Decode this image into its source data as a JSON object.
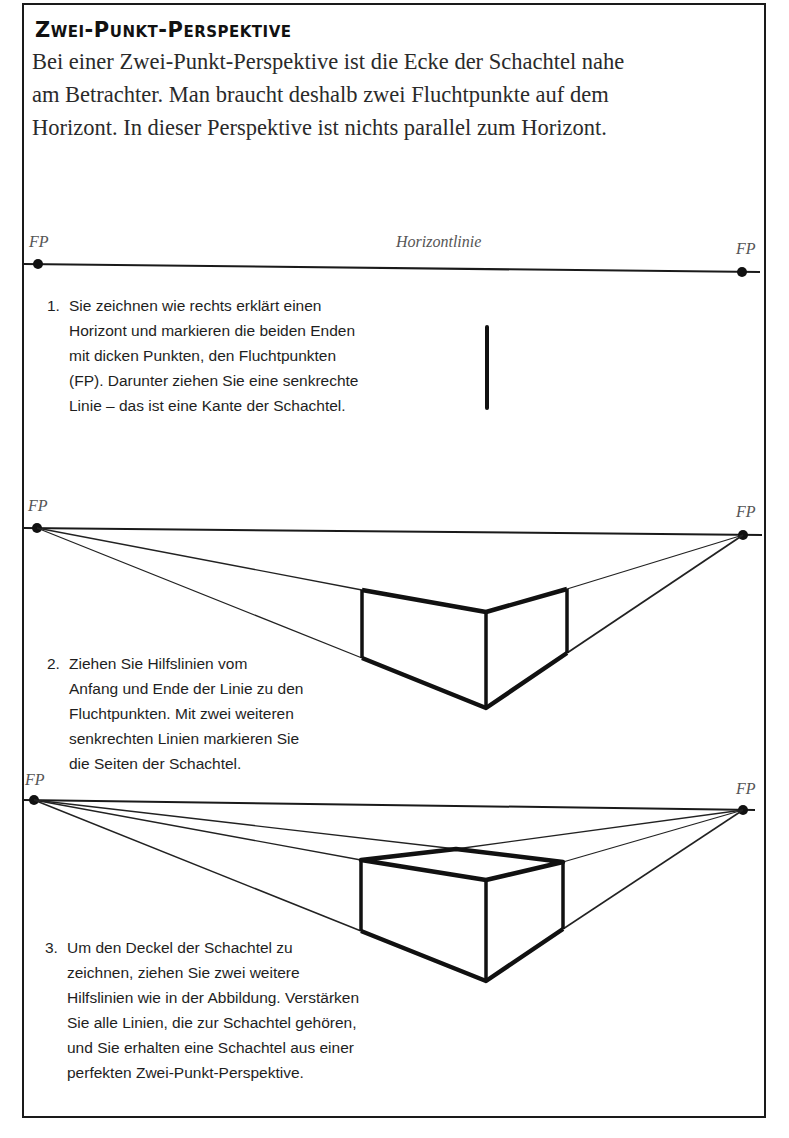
{
  "title": "Zwei-Punkt-Perspektive",
  "intro": {
    "lines": [
      "Bei einer Zwei-Punkt-Perspektive ist die Ecke der Schachtel nahe",
      "am Betrachter. Man braucht deshalb zwei Fluchtpunkte auf dem",
      "Horizont. In dieser Perspektive ist nichts parallel zum Horizont."
    ]
  },
  "labels": {
    "fp": "FP",
    "horizon": "Horizontlinie"
  },
  "steps": [
    {
      "number": "1.",
      "lines": [
        "Sie zeichnen wie rechts erklärt einen",
        "Horizont und markieren die beiden Enden",
        "mit dicken Punkten, den Fluchtpunkten",
        "(FP). Darunter ziehen Sie eine senkrechte",
        "Linie – das ist eine Kante der Schachtel."
      ]
    },
    {
      "number": "2.",
      "lines": [
        "Ziehen Sie Hilfslinien vom",
        "Anfang und Ende der Linie zu den",
        "Fluchtpunkten. Mit zwei weiteren",
        "senkrechten Linien markieren Sie",
        "die Seiten der Schachtel."
      ]
    },
    {
      "number": "3.",
      "lines": [
        "Um den Deckel der Schachtel zu",
        "zeichnen, ziehen Sie zwei weitere",
        "Hilfslinien wie in der Abbildung. Verstärken",
        "Sie alle Linien, die zur Schachtel gehören,",
        "und Sie erhalten eine Schachtel aus einer",
        "perfekten Zwei-Punkt-Perspektive."
      ]
    }
  ],
  "colors": {
    "ink": "#1a1a1a",
    "label": "#555555",
    "paper": "#ffffff"
  }
}
